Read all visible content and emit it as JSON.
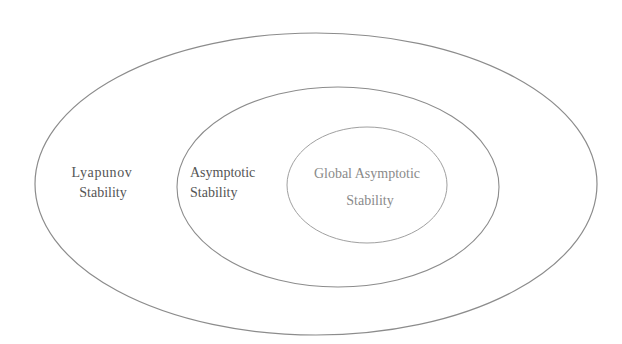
{
  "diagram": {
    "type": "nested-venn",
    "sets": [
      {
        "id": "lyapunov",
        "label_lines": [
          "Lyapunov",
          "Stability"
        ],
        "contains": "asymptotic"
      },
      {
        "id": "asymptotic",
        "label_lines": [
          "Asymptotic",
          "Stability"
        ],
        "contains": "global"
      },
      {
        "id": "global",
        "label_lines": [
          "Global Asymptotic",
          "Stability"
        ]
      }
    ],
    "colors": {
      "background": "#ffffff",
      "stroke": "#8c8c8c",
      "text": "#555555",
      "text_inner": "#8a8a8a"
    }
  }
}
